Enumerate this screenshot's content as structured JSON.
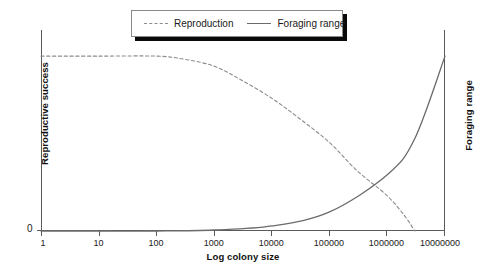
{
  "chart_data": {
    "type": "line",
    "title": "",
    "xlabel": "Log colony size",
    "ylabel": "Reproductive success",
    "y2label": "Foraging range",
    "grid": false,
    "legend_position": "top-center",
    "xscale": "log",
    "xlim": [
      1,
      10000000
    ],
    "ylim": [
      0,
      1
    ],
    "xticks": [
      "1",
      "10",
      "100",
      "1000",
      "10000",
      "100000",
      "1000000",
      "10000000"
    ],
    "yticks": [
      "0"
    ],
    "series": [
      {
        "name": "Reproduction",
        "axis": "left",
        "style": "dashed",
        "color": "#8c8c8c",
        "x": [
          1,
          10,
          100,
          300,
          1000,
          3000,
          10000,
          30000,
          100000,
          300000,
          1000000,
          2000000,
          3000000
        ],
        "y": [
          0.87,
          0.87,
          0.87,
          0.855,
          0.82,
          0.75,
          0.66,
          0.56,
          0.44,
          0.3,
          0.175,
          0.075,
          0.0
        ]
      },
      {
        "name": "Foraging range",
        "axis": "right",
        "style": "solid",
        "color": "#6b6b6b",
        "x": [
          1,
          10,
          100,
          1000,
          10000,
          100000,
          1000000,
          3000000,
          10000000
        ],
        "y": [
          0.0,
          0.0,
          0.0,
          0.005,
          0.025,
          0.095,
          0.28,
          0.46,
          0.87
        ]
      }
    ]
  },
  "legend": {
    "entries": [
      {
        "label": "Reproduction",
        "style": "dashed"
      },
      {
        "label": "Foraging range",
        "style": "solid"
      }
    ]
  },
  "axes": {
    "x_title": "Log colony size",
    "y_left_title": "Reproductive success",
    "y_right_title": "Foraging range",
    "y_zero_label": "0",
    "x_tick_labels": [
      "1",
      "10",
      "100",
      "1000",
      "10000",
      "100000",
      "1000000",
      "10000000"
    ]
  },
  "colors": {
    "axis": "#5a5a5a",
    "dashed_series": "#8c8c8c",
    "solid_series": "#6b6b6b",
    "text": "#1a1a1a",
    "legend_shadow": "#0a0a0a",
    "background": "#ffffff"
  }
}
